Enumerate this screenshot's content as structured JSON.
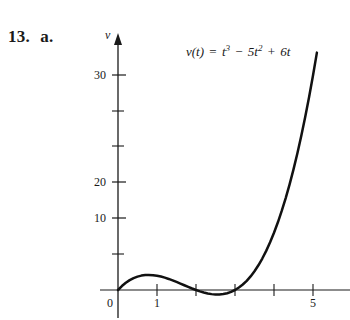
{
  "problem": {
    "number": "13.",
    "part": "a."
  },
  "chart_data": {
    "type": "line",
    "title": "",
    "equation_text": {
      "function": "v(t)",
      "equals": "=",
      "term1_base": "t",
      "term1_exp": "3",
      "minus": "−",
      "term2": "5t",
      "term2_exp": "2",
      "plus": "+",
      "term3": "6t",
      "full": "v(t) = t³ − 5t² + 6t"
    },
    "xlabel": "",
    "ylabel": "v",
    "xlim": [
      -0.45,
      5.95
    ],
    "ylim": [
      -3.6,
      36.5
    ],
    "grid": false,
    "legend": null,
    "x_major_ticks": [
      0,
      1,
      2,
      3,
      4,
      5
    ],
    "x_tick_labels": [
      "0",
      "1",
      "",
      "",
      "",
      "5"
    ],
    "y_major_ticks": [
      10,
      20,
      30
    ],
    "y_major_tick_labels": [
      "10",
      "20",
      "30"
    ],
    "y_minor_ticks": [
      5,
      15,
      25
    ],
    "origin_label": "0",
    "x": [
      0,
      0.1,
      0.2,
      0.3,
      0.4,
      0.5,
      0.6,
      0.7,
      0.785,
      0.9,
      1,
      1.1,
      1.2,
      1.3,
      1.4,
      1.5,
      1.6,
      1.7,
      1.8,
      1.9,
      2,
      2.1,
      2.2,
      2.3,
      2.4,
      2.5,
      2.6,
      2.7,
      2.8,
      2.9,
      3,
      3.1,
      3.2,
      3.3,
      3.4,
      3.5,
      3.6,
      3.7,
      3.8,
      3.9,
      4,
      4.1,
      4.2,
      4.3,
      4.4,
      4.5,
      4.6,
      4.7,
      4.8,
      4.9,
      5,
      5.1,
      5.2
    ],
    "y": [
      0,
      0.551,
      1.008,
      1.377,
      1.664,
      1.875,
      2.016,
      2.093,
      2.113,
      2.079,
      2,
      1.881,
      1.728,
      1.547,
      1.344,
      1.125,
      0.896,
      0.663,
      0.432,
      0.209,
      0,
      -0.189,
      -0.352,
      -0.483,
      -0.576,
      -0.625,
      -0.624,
      -0.567,
      -0.448,
      -0.261,
      0,
      0.341,
      0.768,
      1.287,
      1.904,
      2.625,
      3.456,
      4.403,
      5.472,
      6.669,
      8,
      9.471,
      11.088,
      12.857,
      14.784,
      16.875,
      19.136,
      21.573,
      24.192,
      26.999,
      30,
      33.201,
      36.608
    ],
    "local_max": {
      "t": 0.785,
      "v": 2.113
    },
    "local_min": {
      "t": 2.549,
      "v": -0.631
    },
    "roots": [
      0,
      2,
      3
    ]
  }
}
